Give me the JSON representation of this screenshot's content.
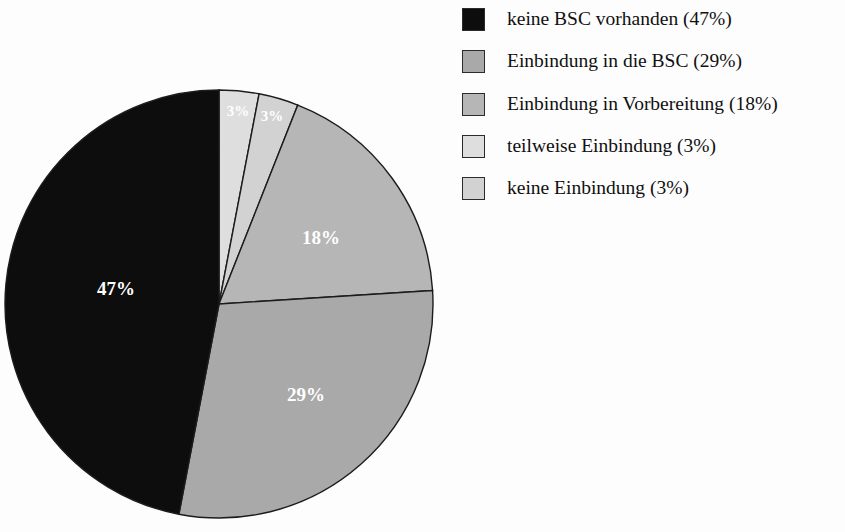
{
  "chart_data": {
    "type": "pie",
    "title": "",
    "subtitle": "",
    "xlabel": "",
    "ylabel": "",
    "grid": false,
    "legend_position": "right",
    "start_angle_deg": 0,
    "direction": "clockwise",
    "categories": [
      "keine BSC vorhanden",
      "Einbindung in die BSC",
      "Einbindung in Vorbereitung",
      "teilweise Einbindung",
      "keine Einbindung"
    ],
    "values": [
      47,
      29,
      18,
      3,
      3
    ],
    "value_unit": "%",
    "colors": [
      "#0d0d0d",
      "#a9a9a9",
      "#b6b6b6",
      "#dedede",
      "#d2d2d2"
    ],
    "slices": [
      {
        "label": "keine BSC vorhanden",
        "value": 47,
        "display": "47%",
        "color": "#0d0d0d",
        "legend_text": "keine BSC vorhanden (47%)",
        "draw_order": 5,
        "start_deg": 190.8,
        "end_deg": 360.0,
        "label_x": 116,
        "label_y": 291,
        "label_color": "#ffffff",
        "label_shown": true
      },
      {
        "label": "Einbindung in die BSC",
        "value": 29,
        "display": "29%",
        "color": "#a9a9a9",
        "legend_text": "Einbindung in die BSC (29%)",
        "draw_order": 4,
        "start_deg": 86.4,
        "end_deg": 190.8,
        "label_x": 306,
        "label_y": 397,
        "label_color": "#ffffff",
        "label_shown": true
      },
      {
        "label": "Einbindung in Vorbereitung",
        "value": 18,
        "display": "18%",
        "color": "#b6b6b6",
        "legend_text": "Einbindung in Vorbereitung (18%)",
        "draw_order": 3,
        "start_deg": 21.6,
        "end_deg": 86.4,
        "label_x": 321,
        "label_y": 240,
        "label_color": "#ffffff",
        "label_shown": true
      },
      {
        "label": "teilweise Einbindung",
        "value": 3,
        "display": "3%",
        "color": "#dedede",
        "legend_text": "teilweise Einbindung (3%)",
        "draw_order": 1,
        "start_deg": 0.0,
        "end_deg": 10.8,
        "label_x": 238,
        "label_y": 113,
        "label_color": "#ffffff",
        "label_shown": true
      },
      {
        "label": "keine Einbindung",
        "value": 3,
        "display": "3%",
        "color": "#d2d2d2",
        "legend_text": "keine Einbindung (3%)",
        "draw_order": 2,
        "start_deg": 10.8,
        "end_deg": 21.6,
        "label_x": 272,
        "label_y": 118,
        "label_color": "#ffffff",
        "label_shown": true
      }
    ],
    "geometry": {
      "center_x": 219,
      "center_y": 304,
      "radius": 214
    }
  },
  "legend": {
    "items": [
      {
        "text": "keine BSC vorhanden (47%)",
        "color": "#0d0d0d"
      },
      {
        "text": "Einbindung in die BSC (29%)",
        "color": "#a9a9a9"
      },
      {
        "text": "Einbindung in Vorbereitung (18%)",
        "color": "#b6b6b6"
      },
      {
        "text": "teilweise Einbindung (3%)",
        "color": "#dedede"
      },
      {
        "text": "keine Einbindung (3%)",
        "color": "#d2d2d2"
      }
    ]
  },
  "colors": {
    "background": "#fdfdfd",
    "outline": "#1c1c1c",
    "label_text": "#ffffff",
    "legend_text": "#101010"
  }
}
